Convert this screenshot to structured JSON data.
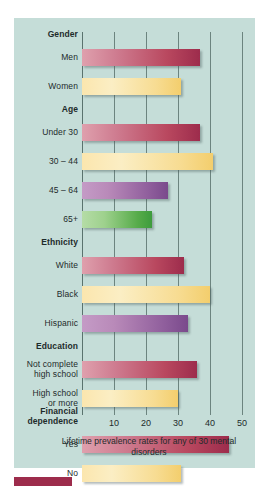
{
  "chart_data": {
    "type": "bar",
    "orientation": "horizontal",
    "title": "",
    "caption": "Lifetime prevalence rates for any of 30 mental disorders",
    "xlabel": "",
    "ylabel": "",
    "xlim": [
      0,
      52
    ],
    "grid": true,
    "legend": "none",
    "xticks": [
      10,
      20,
      30,
      40,
      50
    ],
    "xtick_labels": [
      "10",
      "20",
      "30",
      "40",
      "50"
    ],
    "groups": [
      {
        "name": "Gender",
        "rows": [
          {
            "label": "Men",
            "value": 37,
            "color": "#9d2c4c",
            "color_name": "crimson"
          },
          {
            "label": "Women",
            "value": 31,
            "color": "#f3ce6d",
            "color_name": "yellow"
          }
        ]
      },
      {
        "name": "Age",
        "rows": [
          {
            "label": "Under 30",
            "value": 37,
            "color": "#9d2c4c",
            "color_name": "crimson"
          },
          {
            "label": "30 – 44",
            "value": 41,
            "color": "#f3ce6d",
            "color_name": "yellow"
          },
          {
            "label": "45 – 64",
            "value": 27,
            "color": "#7a4a8c",
            "color_name": "purple"
          },
          {
            "label": "65+",
            "value": 22,
            "color": "#3d9c3d",
            "color_name": "green"
          }
        ]
      },
      {
        "name": "Ethnicity",
        "rows": [
          {
            "label": "White",
            "value": 32,
            "color": "#9d2c4c",
            "color_name": "crimson"
          },
          {
            "label": "Black",
            "value": 40,
            "color": "#f3ce6d",
            "color_name": "yellow"
          },
          {
            "label": "Hispanic",
            "value": 33,
            "color": "#7a4a8c",
            "color_name": "purple"
          }
        ]
      },
      {
        "name": "Education",
        "rows": [
          {
            "label": "Not complete\nhigh school",
            "value": 36,
            "color": "#9d2c4c",
            "color_name": "crimson"
          },
          {
            "label": "High school\nor more",
            "value": 30,
            "color": "#f3ce6d",
            "color_name": "yellow"
          }
        ]
      },
      {
        "name": "Financial\ndependence",
        "rows": [
          {
            "label": "Yes",
            "value": 46,
            "color": "#9d2c4c",
            "color_name": "crimson"
          },
          {
            "label": "No",
            "value": 31,
            "color": "#f3ce6d",
            "color_name": "yellow"
          }
        ]
      }
    ]
  },
  "colors": {
    "panel_background": "#c5ddd8",
    "page_background": "#ffffff",
    "gridline": "#5c7470",
    "text": "#1d2b2b",
    "crimson": "#9d2c4c",
    "yellow": "#f3ce6d",
    "purple": "#7a4a8c",
    "green": "#3d9c3d",
    "swatch": "#9d2c4c"
  }
}
